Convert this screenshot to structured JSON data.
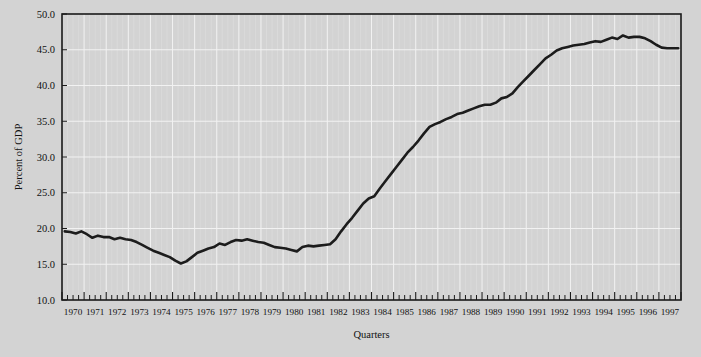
{
  "figure": {
    "background_color": "#d3d3d3",
    "plot_area": {
      "left": 62,
      "top": 14,
      "right": 681,
      "bottom": 300
    }
  },
  "chart_data": {
    "type": "line",
    "title": "",
    "subtitle": "",
    "xlabel": "Quarters",
    "ylabel": "Percent of GDP",
    "xlim": [
      1970.0,
      1997.75
    ],
    "ylim": [
      10.0,
      50.0
    ],
    "grid": true,
    "legend": null,
    "legend_position": "none",
    "line_color": "#1c1c1c",
    "ytick_labels": [
      "10.0",
      "15.0",
      "20.0",
      "25.0",
      "30.0",
      "35.0",
      "40.0",
      "45.0",
      "50.0"
    ],
    "ytick_values": [
      10.0,
      15.0,
      20.0,
      25.0,
      30.0,
      35.0,
      40.0,
      45.0,
      50.0
    ],
    "xtick_labels": [
      "1970",
      "1971",
      "1972",
      "1973",
      "1974",
      "1975",
      "1976",
      "1977",
      "1978",
      "1979",
      "1980",
      "1981",
      "1982",
      "1983",
      "1984",
      "1985",
      "1986",
      "1987",
      "1988",
      "1989",
      "1990",
      "1991",
      "1992",
      "1993",
      "1994",
      "1995",
      "1996",
      "1997"
    ],
    "minor_ticks_per_year": 4,
    "x_quarters": [
      "1970Q1",
      "1970Q2",
      "1970Q3",
      "1970Q4",
      "1971Q1",
      "1971Q2",
      "1971Q3",
      "1971Q4",
      "1972Q1",
      "1972Q2",
      "1972Q3",
      "1972Q4",
      "1973Q1",
      "1973Q2",
      "1973Q3",
      "1973Q4",
      "1974Q1",
      "1974Q2",
      "1974Q3",
      "1974Q4",
      "1975Q1",
      "1975Q2",
      "1975Q3",
      "1975Q4",
      "1976Q1",
      "1976Q2",
      "1976Q3",
      "1976Q4",
      "1977Q1",
      "1977Q2",
      "1977Q3",
      "1977Q4",
      "1978Q1",
      "1978Q2",
      "1978Q3",
      "1978Q4",
      "1979Q1",
      "1979Q2",
      "1979Q3",
      "1979Q4",
      "1980Q1",
      "1980Q2",
      "1980Q3",
      "1980Q4",
      "1981Q1",
      "1981Q2",
      "1981Q3",
      "1981Q4",
      "1982Q1",
      "1982Q2",
      "1982Q3",
      "1982Q4",
      "1983Q1",
      "1983Q2",
      "1983Q3",
      "1983Q4",
      "1984Q1",
      "1984Q2",
      "1984Q3",
      "1984Q4",
      "1985Q1",
      "1985Q2",
      "1985Q3",
      "1985Q4",
      "1986Q1",
      "1986Q2",
      "1986Q3",
      "1986Q4",
      "1987Q1",
      "1987Q2",
      "1987Q3",
      "1987Q4",
      "1988Q1",
      "1988Q2",
      "1988Q3",
      "1988Q4",
      "1989Q1",
      "1989Q2",
      "1989Q3",
      "1989Q4",
      "1990Q1",
      "1990Q2",
      "1990Q3",
      "1990Q4",
      "1991Q1",
      "1991Q2",
      "1991Q3",
      "1991Q4",
      "1992Q1",
      "1992Q2",
      "1992Q3",
      "1992Q4",
      "1993Q1",
      "1993Q2",
      "1993Q3",
      "1993Q4",
      "1994Q1",
      "1994Q2",
      "1994Q3",
      "1994Q4",
      "1995Q1",
      "1995Q2",
      "1995Q3",
      "1995Q4",
      "1996Q1",
      "1996Q2",
      "1996Q3",
      "1996Q4",
      "1997Q1",
      "1997Q2",
      "1997Q3",
      "1997Q4"
    ],
    "values": [
      19.6,
      19.5,
      19.3,
      19.6,
      19.2,
      18.7,
      19.0,
      18.8,
      18.8,
      18.5,
      18.7,
      18.5,
      18.4,
      18.1,
      17.7,
      17.3,
      16.9,
      16.6,
      16.3,
      16.0,
      15.5,
      15.1,
      15.4,
      16.0,
      16.6,
      16.9,
      17.2,
      17.4,
      17.9,
      17.7,
      18.1,
      18.4,
      18.3,
      18.5,
      18.3,
      18.1,
      18.0,
      17.7,
      17.4,
      17.3,
      17.2,
      17.0,
      16.8,
      17.4,
      17.6,
      17.5,
      17.6,
      17.7,
      17.8,
      18.5,
      19.6,
      20.6,
      21.5,
      22.5,
      23.5,
      24.2,
      24.5,
      25.6,
      26.6,
      27.6,
      28.6,
      29.6,
      30.6,
      31.4,
      32.3,
      33.3,
      34.2,
      34.6,
      34.9,
      35.3,
      35.6,
      36.0,
      36.2,
      36.5,
      36.8,
      37.1,
      37.3,
      37.3,
      37.6,
      38.2,
      38.4,
      38.9,
      39.8,
      40.6,
      41.4,
      42.2,
      43.0,
      43.8,
      44.3,
      44.9,
      45.2,
      45.4,
      45.6,
      45.7,
      45.8,
      46.0,
      46.2,
      46.1,
      46.4,
      46.7,
      46.5,
      47.0,
      46.7,
      46.8,
      46.8,
      46.6,
      46.2,
      45.7,
      45.3,
      45.2,
      45.2,
      45.2
    ]
  }
}
